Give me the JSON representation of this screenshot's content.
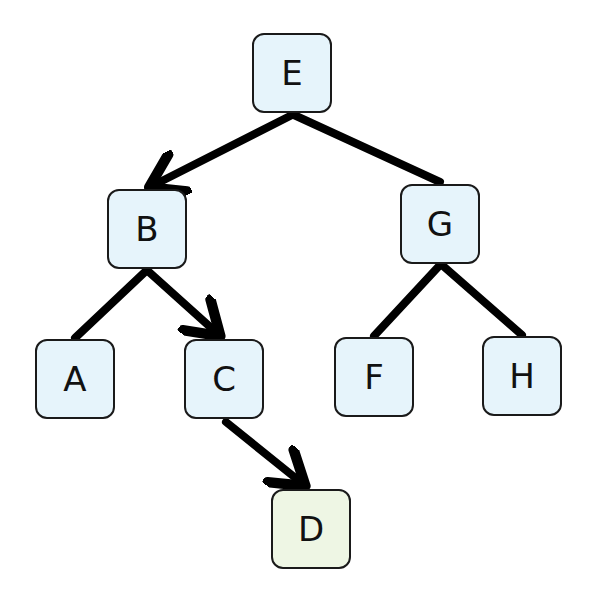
{
  "diagram": {
    "type": "binary-search-tree",
    "colors": {
      "node_fill": "#e6f4fb",
      "highlight_fill": "#eef6e4",
      "border": "#1a1a1a",
      "edge": "#000000"
    },
    "nodes": {
      "E": {
        "label": "E",
        "x": 252,
        "y": 33
      },
      "B": {
        "label": "B",
        "x": 107,
        "y": 189
      },
      "G": {
        "label": "G",
        "x": 400,
        "y": 184
      },
      "A": {
        "label": "A",
        "x": 35,
        "y": 339
      },
      "C": {
        "label": "C",
        "x": 184,
        "y": 339
      },
      "F": {
        "label": "F",
        "x": 334,
        "y": 337
      },
      "H": {
        "label": "H",
        "x": 482,
        "y": 336
      },
      "D": {
        "label": "D",
        "x": 271,
        "y": 489,
        "highlight": true
      }
    },
    "edges": [
      {
        "from": "E",
        "to": "B",
        "arrow": true
      },
      {
        "from": "E",
        "to": "G",
        "arrow": false
      },
      {
        "from": "B",
        "to": "A",
        "arrow": false
      },
      {
        "from": "B",
        "to": "C",
        "arrow": true
      },
      {
        "from": "G",
        "to": "F",
        "arrow": false
      },
      {
        "from": "G",
        "to": "H",
        "arrow": false
      },
      {
        "from": "C",
        "to": "D",
        "arrow": true
      }
    ]
  }
}
